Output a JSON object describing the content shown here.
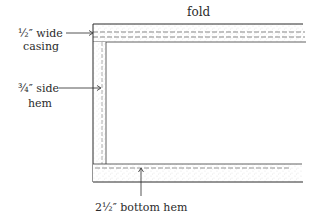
{
  "diagram": {
    "type": "sewing-hem-diagram",
    "labels": {
      "fold": "fold",
      "casing_line1": "½″ wide",
      "casing_line2": "casing",
      "side_hem_line1": "¾″ side",
      "side_hem_line2": "hem",
      "bottom_hem": "2½″ bottom hem"
    },
    "colors": {
      "line": "#2a2a2a",
      "stipple": "#8a8a8a",
      "background": "#ffffff"
    }
  }
}
